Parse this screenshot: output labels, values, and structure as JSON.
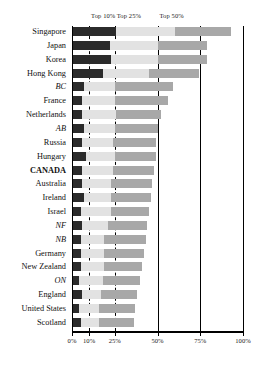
{
  "chart_data": {
    "type": "bar",
    "orientation": "horizontal",
    "stacked": true,
    "title": "",
    "xlabel": "",
    "ylabel": "",
    "xlim": [
      0,
      100
    ],
    "grid": false,
    "legend_position": "top",
    "column_headers": [
      "Top 10%",
      "Top 25%",
      "Top 50%"
    ],
    "xticks": [
      0,
      10,
      25,
      50,
      75,
      100
    ],
    "xtick_labels": [
      "0%",
      "10%",
      "25%",
      "50%",
      "75%",
      "100%"
    ],
    "reference_lines": [
      {
        "value": 10,
        "style": "dashed"
      },
      {
        "value": 25,
        "style": "dashed"
      },
      {
        "value": 50,
        "style": "solid"
      },
      {
        "value": 75,
        "style": "solid"
      },
      {
        "value": 100,
        "style": "solid"
      }
    ],
    "series": [
      {
        "name": "Top 10%",
        "color": "#2b2b2b"
      },
      {
        "name": "Top 25%",
        "color": "#e2e2e2"
      },
      {
        "name": "Top 50%",
        "color": "#a8a8a8"
      }
    ],
    "categories": [
      "Singapore",
      "Japan",
      "Korea",
      "Hong Kong",
      "BC",
      "France",
      "Netherlands",
      "AB",
      "Russia",
      "Hungary",
      "CANADA",
      "Australia",
      "Ireland",
      "Israel",
      "NF",
      "NB",
      "Germany",
      "New Zealand",
      "ON",
      "England",
      "United States",
      "Scotland"
    ],
    "category_styles": [
      "normal",
      "normal",
      "normal",
      "normal",
      "italic",
      "normal",
      "normal",
      "italic",
      "normal",
      "normal",
      "bold",
      "normal",
      "normal",
      "normal",
      "italic",
      "italic",
      "normal",
      "normal",
      "italic",
      "normal",
      "normal",
      "normal"
    ],
    "rows": [
      {
        "label": "Singapore",
        "top10": 26,
        "top25": 60,
        "top50": 93
      },
      {
        "label": "Japan",
        "top10": 22,
        "top25": 50,
        "top50": 79
      },
      {
        "label": "Korea",
        "top10": 23,
        "top25": 50,
        "top50": 79
      },
      {
        "label": "Hong Kong",
        "top10": 18,
        "top25": 45,
        "top50": 74
      },
      {
        "label": "BC",
        "top10": 7,
        "top25": 25,
        "top50": 59
      },
      {
        "label": "France",
        "top10": 6,
        "top25": 25,
        "top50": 56
      },
      {
        "label": "Netherlands",
        "top10": 6,
        "top25": 26,
        "top50": 52
      },
      {
        "label": "AB",
        "top10": 7,
        "top25": 25,
        "top50": 50
      },
      {
        "label": "Russia",
        "top10": 6,
        "top25": 24,
        "top50": 49
      },
      {
        "label": "Hungary",
        "top10": 8,
        "top25": 25,
        "top50": 49
      },
      {
        "label": "CANADA",
        "top10": 6,
        "top25": 24,
        "top50": 48
      },
      {
        "label": "Australia",
        "top10": 6,
        "top25": 23,
        "top50": 47
      },
      {
        "label": "Ireland",
        "top10": 7,
        "top25": 23,
        "top50": 46
      },
      {
        "label": "Israel",
        "top10": 5,
        "top25": 23,
        "top50": 45
      },
      {
        "label": "NF",
        "top10": 6,
        "top25": 21,
        "top50": 44
      },
      {
        "label": "NB",
        "top10": 5,
        "top25": 19,
        "top50": 43
      },
      {
        "label": "Germany",
        "top10": 5,
        "top25": 19,
        "top50": 42
      },
      {
        "label": "New Zealand",
        "top10": 5,
        "top25": 19,
        "top50": 41
      },
      {
        "label": "ON",
        "top10": 4,
        "top25": 18,
        "top50": 40
      },
      {
        "label": "England",
        "top10": 6,
        "top25": 17,
        "top50": 38
      },
      {
        "label": "United States",
        "top10": 4,
        "top25": 16,
        "top50": 37
      },
      {
        "label": "Scotland",
        "top10": 5,
        "top25": 16,
        "top50": 36
      }
    ]
  }
}
